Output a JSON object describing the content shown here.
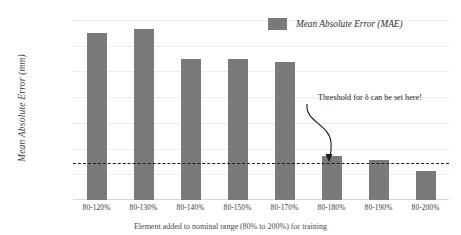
{
  "chart_data": {
    "type": "bar",
    "title": "",
    "xlabel": "Element added to nominal range (80% to 200%) for training",
    "ylabel": "Mean Absolute Error (mm)",
    "categories": [
      "80-120%",
      "80-130%",
      "80-140%",
      "80-150%",
      "80-170%",
      "80-180%",
      "80-190%",
      "80-200%"
    ],
    "values": [
      0.13,
      0.133,
      0.11,
      0.11,
      0.107,
      0.0345,
      0.031,
      0.0222
    ],
    "series": [
      {
        "name": "Mean Absolute Error (MAE)",
        "values": [
          0.13,
          0.133,
          0.11,
          0.11,
          0.107,
          0.0345,
          0.031,
          0.0222
        ]
      }
    ],
    "ylim": [
      0.0,
      0.14
    ],
    "ytick_values": [
      0.14,
      0.12,
      0.1,
      0.08,
      0.06,
      0.04,
      0.02,
      0.0
    ],
    "ytick_labels": [
      "1.40E-01",
      "1.20E-01",
      "1.00E-01",
      "8.00E-02",
      "6.00E-02",
      "4.00E-02",
      "2.00E-02",
      "0.00E+00"
    ],
    "grid": true,
    "legend_position": "top-right",
    "bar_color": "#7a7a7a",
    "threshold": {
      "value": 0.0285,
      "style": "dashed",
      "color": "#1c1c1c",
      "label": "Threshold for δ can be set here!"
    }
  },
  "legend": {
    "entries": [
      {
        "label": "Mean Absolute Error (MAE)",
        "color": "#7a7a7a"
      }
    ]
  },
  "axes": {
    "y_title": "Mean Absolute Error (mm)",
    "x_caption": "Element added to nominal range (80% to 200%) for training"
  },
  "annotation": {
    "text": "Threshold for δ can be set here!"
  }
}
